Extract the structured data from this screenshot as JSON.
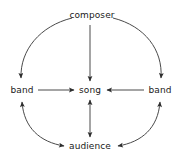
{
  "diagram": {
    "type": "node-link-diagram",
    "background_color": "#ffffff",
    "stroke_color": "#3a3a3a",
    "text_color": "#1a1a1a",
    "nodes": [
      {
        "id": "composer",
        "label": "composer",
        "x": 92,
        "y": 15
      },
      {
        "id": "band_left",
        "label": "band",
        "x": 22,
        "y": 90
      },
      {
        "id": "song",
        "label": "song",
        "x": 90,
        "y": 90
      },
      {
        "id": "band_right",
        "label": "band",
        "x": 160,
        "y": 90
      },
      {
        "id": "audience",
        "label": "audience",
        "x": 90,
        "y": 146
      }
    ],
    "edges": [
      {
        "id": "composer-to-song",
        "from": "composer",
        "to": "song",
        "shape": "straight",
        "direction": "one-way"
      },
      {
        "id": "composer-to-band-left",
        "from": "composer",
        "to": "band_left",
        "shape": "curve",
        "direction": "one-way"
      },
      {
        "id": "composer-to-band-right",
        "from": "composer",
        "to": "band_right",
        "shape": "curve",
        "direction": "one-way"
      },
      {
        "id": "band-left-to-song",
        "from": "band_left",
        "to": "song",
        "shape": "straight",
        "direction": "one-way"
      },
      {
        "id": "band-right-to-song",
        "from": "band_right",
        "to": "song",
        "shape": "straight",
        "direction": "one-way"
      },
      {
        "id": "song-audience",
        "from": "song",
        "to": "audience",
        "shape": "straight",
        "direction": "two-way"
      },
      {
        "id": "band-left-audience",
        "from": "band_left",
        "to": "audience",
        "shape": "curve",
        "direction": "two-way"
      },
      {
        "id": "band-right-audience",
        "from": "band_right",
        "to": "audience",
        "shape": "curve",
        "direction": "two-way"
      }
    ]
  }
}
